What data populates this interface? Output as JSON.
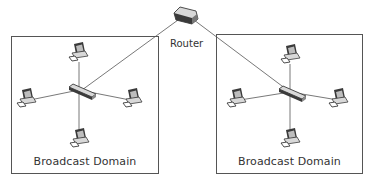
{
  "router": {
    "label": "Router"
  },
  "domains": [
    {
      "label": "Broadcast Domain"
    },
    {
      "label": "Broadcast Domain"
    }
  ],
  "colors": {
    "line": "#555555",
    "device_dark": "#3a3a3a",
    "device_light": "#d8d8d8",
    "screen": "#bdbdbd"
  }
}
